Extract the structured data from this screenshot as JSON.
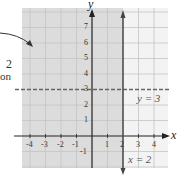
{
  "figure": {
    "axes": {
      "x_label": "x",
      "y_label": "y",
      "x_ticks": [
        "-4",
        "-3",
        "-2",
        "-1",
        "1",
        "2",
        "3",
        "4"
      ],
      "y_ticks": [
        "7",
        "6",
        "5",
        "4",
        "3",
        "2",
        "1",
        "-1"
      ]
    },
    "lines": {
      "vertical": {
        "label": "x = 2",
        "style": "solid"
      },
      "horizontal": {
        "label": "y = 3",
        "style": "dashed"
      }
    },
    "shaded_region": "x ≤ 2",
    "annotation": {
      "line1": "2",
      "line2": "on"
    },
    "colors": {
      "shade": "#d9d9d9",
      "grid": "#c8c8c8",
      "axis": "#222222",
      "line": "#444444",
      "background": "#f4f4f4"
    }
  }
}
